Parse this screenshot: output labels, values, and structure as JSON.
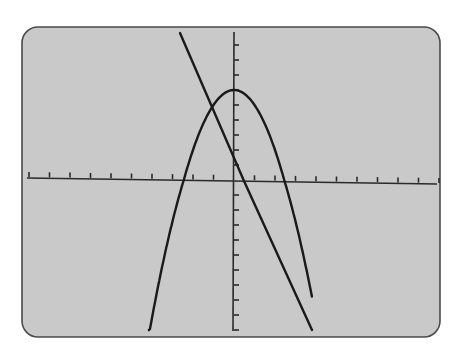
{
  "chart_data": {
    "type": "line",
    "title": "",
    "xlabel": "",
    "ylabel": "",
    "display": "graphing calculator screen",
    "screen_color": "#c9c9c9",
    "border_color": "#4a4a4a",
    "curve_color": "#1a1a1a",
    "grid": false,
    "legend": null,
    "xlim": [
      -10,
      10
    ],
    "ylim": [
      -10,
      10
    ],
    "xscale": 1,
    "yscale": 1,
    "series": [
      {
        "name": "parabola",
        "equation": "y = 6 - x^2",
        "vertex": [
          0,
          6
        ],
        "x_intercepts": [
          -2.45,
          2.45
        ],
        "points": [
          [
            -4,
            -10
          ],
          [
            -3,
            -3
          ],
          [
            -2.45,
            0
          ],
          [
            -2,
            2
          ],
          [
            -1,
            5
          ],
          [
            0,
            6
          ],
          [
            1,
            5
          ],
          [
            2,
            2
          ],
          [
            2.45,
            0
          ],
          [
            3,
            -3
          ],
          [
            3.8,
            -8.4
          ],
          [
            4,
            -10
          ]
        ]
      },
      {
        "name": "line",
        "equation": "y = 2 - 4x",
        "y_intercept": 2,
        "x_intercept": 0.5,
        "points": [
          [
            -2.65,
            10
          ],
          [
            0,
            2
          ],
          [
            0.5,
            0
          ],
          [
            3.8,
            -10
          ]
        ]
      }
    ],
    "intersections": [
      [
        -0.83,
        5.3
      ],
      [
        3.8,
        -10
      ]
    ],
    "x_ticks": 20,
    "y_ticks": 20
  }
}
